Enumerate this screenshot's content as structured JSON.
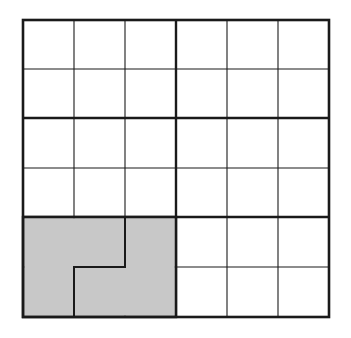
{
  "diagram": {
    "type": "grid-puzzle",
    "columns": 6,
    "rows": 6,
    "block_columns": 3,
    "block_rows": 2,
    "colors": {
      "line": "#1a1a1a",
      "shaded": "#c8c8c8",
      "background": "#ffffff"
    },
    "shaded_cells": [
      [
        4,
        0
      ],
      [
        4,
        1
      ],
      [
        4,
        2
      ],
      [
        5,
        0
      ],
      [
        5,
        1
      ],
      [
        5,
        2
      ]
    ],
    "inner_boundary": {
      "description": "thick line splitting shaded block into two L-shaped pieces",
      "path_cells": [
        [
          4,
          2
        ],
        [
          5,
          2
        ],
        [
          5,
          1
        ],
        [
          6,
          1
        ]
      ]
    }
  }
}
